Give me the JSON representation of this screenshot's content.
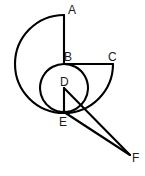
{
  "figure": {
    "background_color": "#ffffff",
    "stroke_color": "#000000",
    "label_color": "#1a1a1a",
    "stroke_width": 2.1,
    "canvas": {
      "width": 145,
      "height": 176
    }
  },
  "points": [
    {
      "id": "A",
      "label": "A",
      "x": 64,
      "y": 15,
      "label_x": 68,
      "label_y": 4
    },
    {
      "id": "B",
      "label": "B",
      "x": 64,
      "y": 64,
      "label_x": 64,
      "label_y": 51
    },
    {
      "id": "C",
      "label": "C",
      "x": 113,
      "y": 64,
      "label_x": 108,
      "label_y": 51
    },
    {
      "id": "D",
      "label": "D",
      "x": 64,
      "y": 88,
      "label_x": 60,
      "label_y": 76
    },
    {
      "id": "E",
      "label": "E",
      "x": 64,
      "y": 112,
      "label_x": 59,
      "label_y": 116
    },
    {
      "id": "F",
      "label": "F",
      "x": 130,
      "y": 155,
      "label_x": 132,
      "label_y": 152
    }
  ],
  "shapes": {
    "outer_semicircle": {
      "name": "semicircle-A-to-E",
      "center": "B",
      "radius": 49,
      "from": "A",
      "to": "E",
      "side": "left",
      "path": "M 64 15 A 49 49 0 0 0 64 113"
    },
    "inner_circle": {
      "name": "circle-centered-D",
      "center": "D",
      "radius": 24,
      "path": "M 64 64 A 24 24 0 1 0 64.01 64"
    },
    "right_semicircle": {
      "name": "semicircle-C-to-E",
      "center": "D",
      "radius": 49,
      "from": "C",
      "to": "E",
      "side": "right",
      "path": "M 113 64 A 49 49 0 0 1 64 113"
    },
    "segments": [
      {
        "name": "segment-A-B",
        "from": "A",
        "to": "B",
        "x1": 64,
        "y1": 15,
        "x2": 64,
        "y2": 64
      },
      {
        "name": "segment-B-C",
        "from": "B",
        "to": "C",
        "x1": 64,
        "y1": 64,
        "x2": 113,
        "y2": 64
      },
      {
        "name": "segment-D-E",
        "from": "D",
        "to": "E",
        "x1": 64,
        "y1": 88,
        "x2": 64,
        "y2": 112
      },
      {
        "name": "segment-D-F",
        "from": "D",
        "to": "F",
        "x1": 64,
        "y1": 88,
        "x2": 130,
        "y2": 155
      },
      {
        "name": "segment-E-F",
        "from": "E",
        "to": "F",
        "x1": 64,
        "y1": 112,
        "x2": 130,
        "y2": 155
      }
    ]
  }
}
